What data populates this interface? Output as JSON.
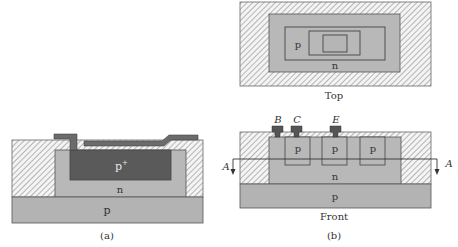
{
  "colors": {
    "oxide_fill": "#f2f2f2",
    "hatch": "#8a8a8a",
    "n_region": "#b8b8b8",
    "p_substrate": "#b3b3b3",
    "p_plus": "#5a5a5a",
    "metal": "#6b6b6b",
    "outline": "#555555",
    "text": "#333333"
  },
  "figure_a": {
    "caption": "(a)",
    "labels": {
      "p_plus_base": "p",
      "p_plus_sup": "+",
      "n": "n",
      "p": "p"
    }
  },
  "figure_b": {
    "caption": "(b)",
    "top_view": {
      "caption": "Top",
      "labels": {
        "p": "p",
        "n": "n"
      }
    },
    "front_view": {
      "caption": "Front",
      "terminals": [
        "B",
        "C",
        "E"
      ],
      "well_labels": [
        "p",
        "p",
        "p"
      ],
      "labels": {
        "n": "n",
        "p": "p"
      },
      "section_marker_left": "A",
      "section_marker_right": "A"
    }
  }
}
